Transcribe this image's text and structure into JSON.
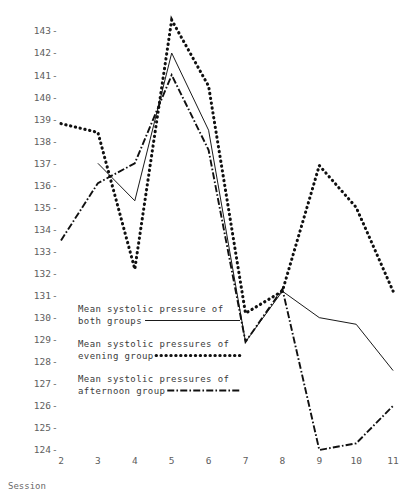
{
  "chart_data": {
    "type": "line",
    "title": "",
    "xlabel": "Session",
    "ylabel": "",
    "x": [
      2,
      3,
      4,
      5,
      6,
      7,
      8,
      9,
      10,
      11
    ],
    "categories": [
      "2",
      "3",
      "4",
      "5",
      "6",
      "7",
      "8",
      "9",
      "10",
      "11"
    ],
    "xlim": [
      2,
      11
    ],
    "ylim": [
      124,
      143
    ],
    "yticks": [
      124,
      125,
      126,
      127,
      128,
      129,
      130,
      131,
      132,
      133,
      134,
      135,
      136,
      137,
      138,
      139,
      140,
      141,
      142,
      143
    ],
    "grid": false,
    "legend_position": "lower-left",
    "series": [
      {
        "name": "Mean systolic pressure of both groups",
        "style": "solid",
        "x": [
          3,
          4,
          5,
          6,
          7,
          8,
          9,
          10,
          11
        ],
        "values": [
          137.0,
          135.3,
          142.0,
          138.5,
          128.9,
          131.2,
          130.0,
          129.7,
          127.6
        ]
      },
      {
        "name": "Mean systolic pressures of evening group",
        "style": "dotted",
        "x": [
          2,
          3,
          4,
          5,
          6,
          7,
          8,
          9,
          10,
          11
        ],
        "values": [
          138.8,
          138.4,
          132.2,
          143.5,
          140.5,
          130.2,
          131.2,
          136.9,
          135.0,
          131.2
        ]
      },
      {
        "name": "Mean systolic pressures of afternoon group",
        "style": "dash-dot",
        "x": [
          2,
          3,
          4,
          5,
          6,
          7,
          8,
          9,
          10,
          11
        ],
        "values": [
          133.5,
          136.1,
          137.0,
          141.0,
          137.6,
          128.9,
          131.3,
          124.0,
          124.3,
          126.0
        ]
      }
    ]
  },
  "axis": {
    "x_title": "Session",
    "tick_dash": "-"
  },
  "legend": {
    "items": [
      {
        "line1": "Mean systolic pressure of",
        "line2": "both groups",
        "style": "solid"
      },
      {
        "line1": "Mean systolic pressures of",
        "line2": "evening group",
        "style": "dotted"
      },
      {
        "line1": "Mean systolic pressures of",
        "line2": "afternoon group",
        "style": "dash-dot"
      }
    ]
  },
  "colors": {
    "ink": "#101010",
    "tick_text": "#5d5d5d",
    "legend_text": "#3a3a3a",
    "background": "#ffffff"
  }
}
